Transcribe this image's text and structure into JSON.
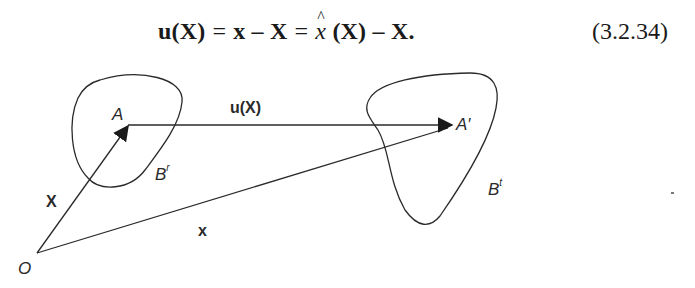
{
  "equation": {
    "lhs": "u(X)",
    "eq1": "=",
    "mid": "x – X",
    "eq2": "=",
    "rhs_func": "x",
    "rhs_arg": "(X)",
    "rhs_tail": "– X.",
    "number": "(3.2.34)"
  },
  "figure": {
    "labels": {
      "origin": "O",
      "point_reference": "A",
      "point_current": "A′",
      "body_reference": "B",
      "body_reference_sup": "r",
      "body_current": "B",
      "body_current_sup": "t",
      "vector_X": "X",
      "vector_x": "x",
      "displacement": "u(X)"
    },
    "colors": {
      "stroke": "#2a2a2a",
      "text": "#2a2a2a",
      "background": "#ffffff"
    }
  }
}
